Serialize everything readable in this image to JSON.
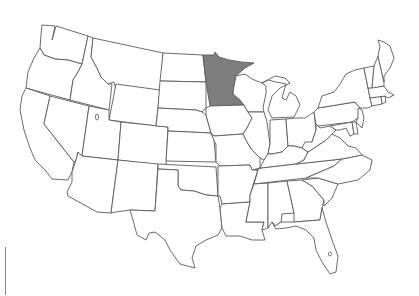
{
  "map": {
    "title": "United States",
    "highlighted_state": "Minnesota",
    "colors": {
      "background": "#ffffff",
      "state_fill": "#ffffff",
      "state_stroke": "#5a5a5a",
      "highlight_fill": "#7d7d7d",
      "scale_bar": "#8a8a8a"
    },
    "states": [
      {
        "name": "Washington",
        "highlight": false
      },
      {
        "name": "Oregon",
        "highlight": false
      },
      {
        "name": "California",
        "highlight": false
      },
      {
        "name": "Idaho",
        "highlight": false
      },
      {
        "name": "Nevada",
        "highlight": false
      },
      {
        "name": "Montana",
        "highlight": false
      },
      {
        "name": "Wyoming",
        "highlight": false
      },
      {
        "name": "Utah",
        "highlight": false
      },
      {
        "name": "Arizona",
        "highlight": false
      },
      {
        "name": "Colorado",
        "highlight": false
      },
      {
        "name": "New Mexico",
        "highlight": false
      },
      {
        "name": "North Dakota",
        "highlight": false
      },
      {
        "name": "South Dakota",
        "highlight": false
      },
      {
        "name": "Nebraska",
        "highlight": false
      },
      {
        "name": "Kansas",
        "highlight": false
      },
      {
        "name": "Oklahoma",
        "highlight": false
      },
      {
        "name": "Texas",
        "highlight": false
      },
      {
        "name": "Minnesota",
        "highlight": true
      },
      {
        "name": "Iowa",
        "highlight": false
      },
      {
        "name": "Missouri",
        "highlight": false
      },
      {
        "name": "Arkansas",
        "highlight": false
      },
      {
        "name": "Louisiana",
        "highlight": false
      },
      {
        "name": "Wisconsin",
        "highlight": false
      },
      {
        "name": "Illinois",
        "highlight": false
      },
      {
        "name": "Michigan",
        "highlight": false
      },
      {
        "name": "Indiana",
        "highlight": false
      },
      {
        "name": "Ohio",
        "highlight": false
      },
      {
        "name": "Kentucky",
        "highlight": false
      },
      {
        "name": "Tennessee",
        "highlight": false
      },
      {
        "name": "Mississippi",
        "highlight": false
      },
      {
        "name": "Alabama",
        "highlight": false
      },
      {
        "name": "Georgia",
        "highlight": false
      },
      {
        "name": "Florida",
        "highlight": false
      },
      {
        "name": "South Carolina",
        "highlight": false
      },
      {
        "name": "North Carolina",
        "highlight": false
      },
      {
        "name": "Virginia",
        "highlight": false
      },
      {
        "name": "West Virginia",
        "highlight": false
      },
      {
        "name": "Pennsylvania",
        "highlight": false
      },
      {
        "name": "New York",
        "highlight": false
      },
      {
        "name": "Maryland",
        "highlight": false
      },
      {
        "name": "Delaware",
        "highlight": false
      },
      {
        "name": "New Jersey",
        "highlight": false
      },
      {
        "name": "Connecticut",
        "highlight": false
      },
      {
        "name": "Rhode Island",
        "highlight": false
      },
      {
        "name": "Massachusetts",
        "highlight": false
      },
      {
        "name": "Vermont",
        "highlight": false
      },
      {
        "name": "New Hampshire",
        "highlight": false
      },
      {
        "name": "Maine",
        "highlight": false
      }
    ]
  }
}
